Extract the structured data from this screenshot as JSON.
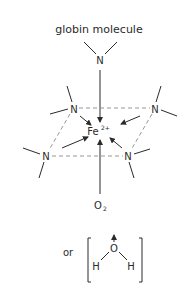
{
  "title": "globin molecule",
  "atoms": {
    "globin_n": "N",
    "n_upper_left": "N",
    "n_upper_right": "N",
    "n_lower_left": "N",
    "n_lower_right": "N",
    "iron": "Fe",
    "iron_charge": "2+",
    "oxygen_main": "O",
    "oxygen_sub": "2",
    "alt_prefix": "or",
    "water_o": "O",
    "water_h_left": "H",
    "water_h_right": "H"
  },
  "colors": {
    "line": "#2a2a2a",
    "dashed": "#8a8a8a"
  }
}
